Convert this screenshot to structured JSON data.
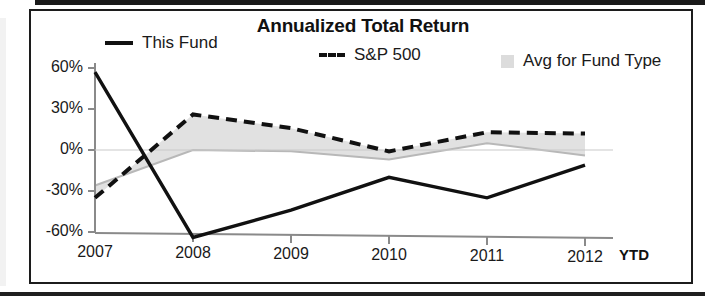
{
  "chart_title": "Annualized Total Return",
  "legend": [
    {
      "label": "This Fund",
      "marker": "solid-line-swatch"
    },
    {
      "label": "S&P 500",
      "marker": "dashed-line-swatch"
    },
    {
      "label": "Avg for Fund Type",
      "marker": "shaded-area-swatch"
    }
  ],
  "axis": {
    "y_ticks": [
      "60%",
      "30%",
      "0%",
      "-30%",
      "-60%"
    ],
    "x_ticks": [
      "2007",
      "2008",
      "2009",
      "2010",
      "2011",
      "2012"
    ],
    "x_suffix": "YTD"
  },
  "colors": {
    "this_fund": "#111111",
    "sp500": "#111111",
    "avg_fund_type_fill": "#dcdcdc",
    "avg_fund_type_line": "#b8b8b8",
    "axis": "#8a8a8a",
    "frame": "#1c1c1c"
  },
  "chart_data": {
    "type": "line",
    "title": "Annualized Total Return",
    "xlabel": "",
    "ylabel": "",
    "categories": [
      "2007",
      "2008",
      "2009",
      "2010",
      "2011",
      "2012"
    ],
    "x_axis_note": "2012 is YTD (year to date)",
    "ylim": [
      -75,
      62
    ],
    "y_ticks": [
      60,
      30,
      0,
      -30,
      -60
    ],
    "grid": false,
    "legend_position": "top",
    "series": [
      {
        "name": "This Fund",
        "style": "solid",
        "color": "#111111",
        "values": [
          57,
          -64,
          -44,
          -20,
          -35,
          -11
        ]
      },
      {
        "name": "S&P 500",
        "style": "dashed",
        "color": "#111111",
        "values": [
          -35,
          26,
          16,
          -1,
          13,
          12
        ]
      },
      {
        "name": "Avg for Fund Type",
        "style": "shaded-area",
        "color": "#dcdcdc",
        "values": [
          -26,
          0,
          -1,
          -7,
          5,
          -4
        ]
      }
    ]
  }
}
